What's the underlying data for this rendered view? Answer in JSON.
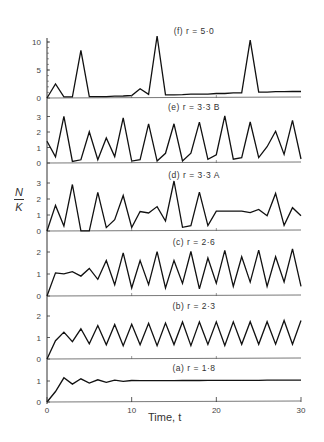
{
  "chart_data": {
    "type": "line",
    "title": "",
    "xlabel": "Time, t",
    "ylabel": "N/K",
    "xlim": [
      0,
      30
    ],
    "x_ticks": [
      0,
      10,
      20,
      30
    ],
    "grid": false,
    "panels": [
      {
        "id": "f",
        "title": "(f) r = 5·0",
        "ylim": [
          0,
          11
        ],
        "y_ticks": [
          0,
          5,
          10
        ],
        "x": [
          0,
          1,
          2,
          3,
          4,
          5,
          6,
          7,
          8,
          9,
          10,
          11,
          12,
          13,
          14,
          15,
          16,
          17,
          18,
          19,
          20,
          21,
          22,
          23,
          24,
          25,
          26,
          27,
          28,
          29,
          30
        ],
        "values": [
          0,
          2.5,
          0.2,
          0.2,
          8.5,
          0.2,
          0.2,
          0.2,
          0.3,
          0.3,
          0.4,
          1.6,
          0.6,
          11,
          0.5,
          0.5,
          0.5,
          0.6,
          0.6,
          0.6,
          0.7,
          0.7,
          0.8,
          0.8,
          10.2,
          0.9,
          0.9,
          1.0,
          1.0,
          1.0,
          1.0
        ]
      },
      {
        "id": "e",
        "title": "(e) r = 3·3 B",
        "ylim": [
          0,
          3.3
        ],
        "y_ticks": [
          0,
          1,
          2,
          3
        ],
        "x": [
          0,
          1,
          2,
          3,
          4,
          5,
          6,
          7,
          8,
          9,
          10,
          11,
          12,
          13,
          14,
          15,
          16,
          17,
          18,
          19,
          20,
          21,
          22,
          23,
          24,
          25,
          26,
          27,
          28,
          29,
          30
        ],
        "values": [
          1.4,
          0.4,
          3.0,
          0.1,
          0.2,
          2.0,
          0.2,
          1.6,
          0.4,
          2.9,
          0.1,
          0.2,
          2.5,
          0.1,
          0.6,
          2.5,
          0.1,
          0.6,
          2.6,
          0.2,
          0.5,
          3.0,
          0.2,
          0.3,
          2.6,
          0.3,
          1.0,
          2.0,
          0.5,
          2.7,
          0.2
        ]
      },
      {
        "id": "d",
        "title": "(d) r = 3·3 A",
        "ylim": [
          0,
          3.3
        ],
        "y_ticks": [
          0,
          1,
          2,
          3
        ],
        "x": [
          0,
          1,
          2,
          3,
          4,
          5,
          6,
          7,
          8,
          9,
          10,
          11,
          12,
          13,
          14,
          15,
          16,
          17,
          18,
          19,
          20,
          21,
          22,
          23,
          24,
          25,
          26,
          27,
          28,
          29,
          30
        ],
        "values": [
          0,
          1.6,
          0.3,
          2.9,
          0,
          0,
          2.4,
          0.2,
          0.7,
          2.2,
          0.2,
          1.2,
          1.1,
          1.5,
          0.6,
          3.1,
          0.2,
          0.3,
          2.4,
          0.3,
          1.2,
          1.2,
          1.2,
          1.2,
          1.1,
          1.3,
          0.9,
          2.3,
          0.3,
          1.4,
          0.9
        ]
      },
      {
        "id": "c",
        "title": "(c) r = 2·6",
        "ylim": [
          0,
          2.4
        ],
        "y_ticks": [
          0,
          1,
          2
        ],
        "x": [
          0,
          1,
          2,
          3,
          4,
          5,
          6,
          7,
          8,
          9,
          10,
          11,
          12,
          13,
          14,
          15,
          16,
          17,
          18,
          19,
          20,
          21,
          22,
          23,
          24,
          25,
          26,
          27,
          28,
          29,
          30
        ],
        "values": [
          0,
          1.05,
          1.0,
          1.1,
          0.9,
          1.25,
          0.75,
          1.6,
          0.5,
          1.95,
          0.35,
          1.6,
          0.5,
          2.0,
          0.35,
          1.6,
          0.55,
          2.0,
          0.3,
          1.7,
          0.55,
          2.05,
          0.4,
          1.75,
          0.6,
          2.05,
          0.4,
          1.75,
          0.6,
          2.1,
          0.4
        ]
      },
      {
        "id": "b",
        "title": "(b) r = 2·3",
        "ylim": [
          0,
          2.4
        ],
        "y_ticks": [
          0,
          1,
          2
        ],
        "x": [
          0,
          1,
          2,
          3,
          4,
          5,
          6,
          7,
          8,
          9,
          10,
          11,
          12,
          13,
          14,
          15,
          16,
          17,
          18,
          19,
          20,
          21,
          22,
          23,
          24,
          25,
          26,
          27,
          28,
          29,
          30
        ],
        "values": [
          0,
          0.85,
          1.25,
          0.8,
          1.4,
          0.7,
          1.55,
          0.65,
          1.6,
          0.6,
          1.6,
          0.65,
          1.65,
          0.6,
          1.65,
          0.65,
          1.7,
          0.6,
          1.7,
          0.65,
          1.7,
          0.6,
          1.7,
          0.65,
          1.7,
          0.65,
          1.7,
          0.65,
          1.75,
          0.65,
          1.75
        ]
      },
      {
        "id": "a",
        "title": "(a) r = 1·8",
        "ylim": [
          0,
          1.4
        ],
        "y_ticks": [
          0,
          1
        ],
        "x": [
          0,
          1,
          2,
          3,
          4,
          5,
          6,
          7,
          8,
          9,
          10,
          11,
          12,
          13,
          14,
          15,
          16,
          17,
          18,
          19,
          20,
          21,
          22,
          23,
          24,
          25,
          26,
          27,
          28,
          29,
          30
        ],
        "values": [
          0,
          0.5,
          1.15,
          0.85,
          1.1,
          0.9,
          1.05,
          0.93,
          1.03,
          0.97,
          1.01,
          1.0,
          1.0,
          1.0,
          1.0,
          1.0,
          1.0,
          1.0,
          1.0,
          1.0,
          1.0,
          1.0,
          1.0,
          1.0,
          1.0,
          1.0,
          1.0,
          1.0,
          1.0,
          1.0,
          1.0
        ]
      }
    ]
  }
}
